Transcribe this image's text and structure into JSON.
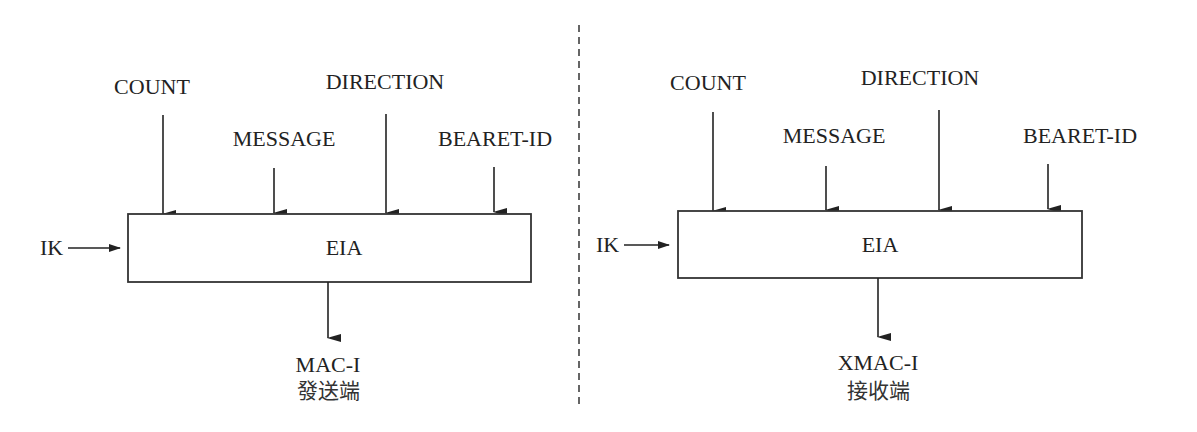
{
  "diagram": {
    "type": "block-diagram",
    "colors": {
      "line": "#222222",
      "background": "#ffffff"
    },
    "panels": [
      {
        "id": "sender",
        "inputs_top": [
          "COUNT",
          "MESSAGE",
          "DIRECTION",
          "BEARET-ID"
        ],
        "input_left": "IK",
        "block": "EIA",
        "output": "MAC-I",
        "caption": "發送端"
      },
      {
        "id": "receiver",
        "inputs_top": [
          "COUNT",
          "MESSAGE",
          "DIRECTION",
          "BEARET-ID"
        ],
        "input_left": "IK",
        "block": "EIA",
        "output": "XMAC-I",
        "caption": "接收端"
      }
    ],
    "separator": "dashed-vertical"
  }
}
